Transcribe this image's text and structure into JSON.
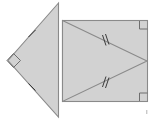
{
  "figure": {
    "title": "Congruent right triangles figure",
    "description": "A large shaded triangle with a right angle at its left vertex and single tick marks on its two slanted sides, adjoined on the right by a shaded rectangle containing an inscribed triangle whose two long sides each carry double tick marks.",
    "background_color": "#ffffff",
    "fill_color": "#d2d2d2",
    "stroke_color": "#8a8a8a",
    "tick_color": "#3a3a3a",
    "right_angle_color": "#6e6e6e",
    "canvas": {
      "width": 160,
      "height": 120
    },
    "shapes": [
      {
        "name": "left-triangle",
        "type": "triangle",
        "vertices": [
          [
            58,
            3
          ],
          [
            8,
            60
          ],
          [
            58,
            117
          ]
        ],
        "right_angle_at": [
          8,
          60
        ],
        "tick_count_per_slant_side": 1
      },
      {
        "name": "rectangle",
        "type": "rectangle",
        "x": 62,
        "y": 20,
        "width": 86,
        "height": 82,
        "right_angle_corners": [
          [
            148,
            20
          ],
          [
            148,
            102
          ]
        ]
      },
      {
        "name": "inner-triangle",
        "type": "triangle",
        "vertices": [
          [
            62,
            20
          ],
          [
            147,
            61
          ],
          [
            62,
            102
          ]
        ],
        "tick_count_per_diagonal": 2
      }
    ],
    "marks": {
      "single_tick_label": "single tick",
      "double_tick_label": "double tick",
      "right_angle_label": "right angle"
    },
    "corner_speck": {
      "name": "page-artifact-speck",
      "x": 146,
      "y": 111
    }
  }
}
